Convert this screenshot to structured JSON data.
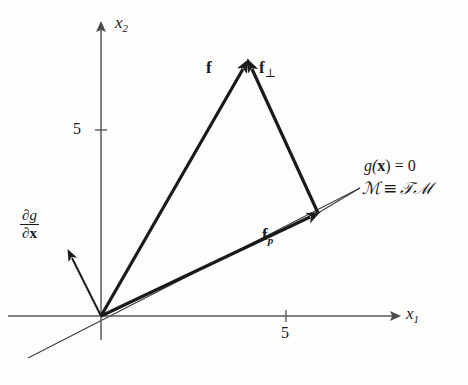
{
  "figure": {
    "background_color": "#fdfdfc",
    "ink_color": "#1a1a1a",
    "axis_color": "#5a5a5a"
  },
  "axes": {
    "x_label": "x",
    "x_subscript": "1",
    "y_label": "x",
    "y_subscript": "2",
    "x_tick_label": "5",
    "y_tick_label": "5",
    "origin": {
      "x": 101,
      "y": 316
    },
    "x_axis_end": {
      "x": 400,
      "y": 316
    },
    "y_axis_end": {
      "x": 101,
      "y": 22
    },
    "x_tick_value": 5,
    "y_tick_value": 5,
    "x_tick_px": 286,
    "y_tick_px": 130
  },
  "vectors": [
    {
      "name": "f",
      "label": "f",
      "label_subscript": "",
      "description": "total force vector from origin to apex",
      "start": {
        "x": 101,
        "y": 316
      },
      "end": {
        "x": 248,
        "y": 60
      },
      "label_pos": {
        "x": 206,
        "y": 60
      },
      "stroke_width": 3.2
    },
    {
      "name": "f_perp",
      "label": "f",
      "label_subscript": "⊥",
      "description": "normal component arrow pointing up-left to apex",
      "start": {
        "x": 318,
        "y": 213
      },
      "end": {
        "x": 248,
        "y": 60
      },
      "label_pos": {
        "x": 258,
        "y": 60
      },
      "stroke_width": 3.2
    },
    {
      "name": "f_p",
      "label": "f",
      "label_subscript": "p",
      "description": "tangential (projected) component along the manifold",
      "start": {
        "x": 101,
        "y": 316
      },
      "end": {
        "x": 318,
        "y": 213
      },
      "label_pos": {
        "x": 266,
        "y": 228
      },
      "stroke_width": 3.2
    },
    {
      "name": "grad_g",
      "label": "∂g/∂x",
      "label_subscript": "",
      "description": "gradient of constraint normal to manifold",
      "start": {
        "x": 101,
        "y": 316
      },
      "end": {
        "x": 68,
        "y": 250
      },
      "label_pos": {
        "x": 18,
        "y": 213
      },
      "stroke_width": 2.0
    }
  ],
  "gradient_label": {
    "numerator_partial": "∂",
    "numerator_var": "g",
    "denominator_partial": "∂",
    "denominator_var": "x"
  },
  "manifold": {
    "line_start": {
      "x": 28,
      "y": 358
    },
    "line_end": {
      "x": 360,
      "y": 188
    },
    "stroke_width": 1.1,
    "constraint_text": "g(x) = 0",
    "constraint_prefix": "g(",
    "constraint_var": "x",
    "constraint_suffix": ") = 0",
    "identity_text": "ℳ ≡ 𝒯ℳ",
    "identity_left": "ℳ",
    "identity_equiv": "≡",
    "identity_right": "𝒯ℳ",
    "text_pos_constraint": {
      "x": 364,
      "y": 160
    },
    "text_pos_identity": {
      "x": 364,
      "y": 182
    }
  }
}
